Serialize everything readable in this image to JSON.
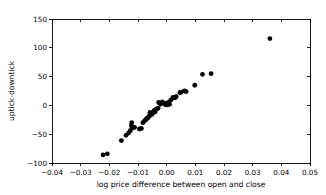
{
  "chart_data": {
    "type": "scatter",
    "title": "",
    "xlabel": "log price difference between open and close",
    "ylabel": "uptick-downtick",
    "xlim": [
      -0.04,
      0.05
    ],
    "ylim": [
      -100,
      150
    ],
    "xticks": [
      -0.04,
      -0.03,
      -0.02,
      -0.01,
      0.0,
      0.01,
      0.02,
      0.03,
      0.04,
      0.05
    ],
    "xticklabels": [
      "−0.04",
      "−0.03",
      "−0.02",
      "−0.01",
      "0.00",
      "0.01",
      "0.02",
      "0.03",
      "0.04",
      "0.05"
    ],
    "yticks": [
      -100,
      -50,
      0,
      50,
      100,
      150
    ],
    "yticklabels": [
      "−100",
      "−50",
      "0",
      "50",
      "100",
      "150"
    ],
    "grid": false,
    "legend": null,
    "marker": "circle",
    "marker_color": "#000000",
    "marker_size": 2.4,
    "points": [
      {
        "x": -0.0222,
        "y": -86
      },
      {
        "x": -0.0207,
        "y": -84
      },
      {
        "x": -0.0158,
        "y": -61
      },
      {
        "x": -0.0142,
        "y": -52
      },
      {
        "x": -0.0133,
        "y": -48
      },
      {
        "x": -0.0127,
        "y": -44
      },
      {
        "x": -0.0123,
        "y": -35
      },
      {
        "x": -0.0122,
        "y": -30
      },
      {
        "x": -0.012,
        "y": -38
      },
      {
        "x": -0.0118,
        "y": -39
      },
      {
        "x": -0.0112,
        "y": -38
      },
      {
        "x": -0.0095,
        "y": -41
      },
      {
        "x": -0.0088,
        "y": -40
      },
      {
        "x": -0.0083,
        "y": -30
      },
      {
        "x": -0.0077,
        "y": -27
      },
      {
        "x": -0.0073,
        "y": -25
      },
      {
        "x": -0.007,
        "y": -23
      },
      {
        "x": -0.0066,
        "y": -22
      },
      {
        "x": -0.0063,
        "y": -20
      },
      {
        "x": -0.006,
        "y": -18
      },
      {
        "x": -0.0058,
        "y": -12
      },
      {
        "x": -0.0052,
        "y": -16
      },
      {
        "x": -0.0048,
        "y": -13
      },
      {
        "x": -0.0044,
        "y": -9
      },
      {
        "x": -0.004,
        "y": -11
      },
      {
        "x": -0.0036,
        "y": -6
      },
      {
        "x": -0.003,
        "y": -5
      },
      {
        "x": -0.0028,
        "y": 5
      },
      {
        "x": -0.0022,
        "y": 2
      },
      {
        "x": -0.0015,
        "y": 6
      },
      {
        "x": -0.0008,
        "y": 3
      },
      {
        "x": -0.0004,
        "y": 1
      },
      {
        "x": -0.0002,
        "y": 2
      },
      {
        "x": 0.0,
        "y": 4
      },
      {
        "x": 0.0002,
        "y": 3
      },
      {
        "x": 0.0004,
        "y": 1
      },
      {
        "x": 0.0006,
        "y": 5
      },
      {
        "x": 0.001,
        "y": 2
      },
      {
        "x": 0.0014,
        "y": 9
      },
      {
        "x": 0.0022,
        "y": 14
      },
      {
        "x": 0.0028,
        "y": 13
      },
      {
        "x": 0.0033,
        "y": 15
      },
      {
        "x": 0.0046,
        "y": 22
      },
      {
        "x": 0.005,
        "y": 23
      },
      {
        "x": 0.0062,
        "y": 25
      },
      {
        "x": 0.0068,
        "y": 24
      },
      {
        "x": 0.0098,
        "y": 35
      },
      {
        "x": 0.0125,
        "y": 54
      },
      {
        "x": 0.0155,
        "y": 55
      },
      {
        "x": 0.036,
        "y": 116
      }
    ]
  },
  "axes": {
    "plot_left_px": 52,
    "plot_right_px": 310,
    "plot_top_px": 19,
    "plot_bottom_px": 163
  }
}
